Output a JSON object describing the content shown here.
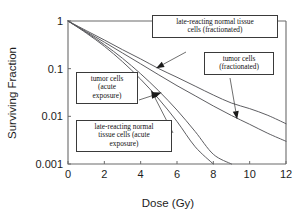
{
  "chart_data": {
    "type": "line",
    "title": "",
    "xlabel": "Dose (Gy)",
    "ylabel": "Surviving Fraction",
    "xlim": [
      0,
      12
    ],
    "ylim": [
      0.001,
      1
    ],
    "yscale": "log",
    "grid": false,
    "legend_position": "annotations",
    "xticks": [
      "0",
      "2",
      "4",
      "6",
      "8",
      "10",
      "12"
    ],
    "xtick_values": [
      0,
      2,
      4,
      6,
      8,
      10,
      12
    ],
    "yticks": [
      "1",
      "0.1",
      "0.01",
      "0.001"
    ],
    "ytick_values": [
      1,
      0.1,
      0.01,
      0.001
    ],
    "x": [
      0,
      1,
      2,
      3,
      4,
      5,
      6,
      7,
      8,
      9,
      10,
      11,
      12
    ],
    "series": [
      {
        "name": "late-reacting normal tissue cells (fractionated)",
        "values": [
          1,
          0.63,
          0.4,
          0.25,
          0.16,
          0.1,
          0.066,
          0.043,
          0.028,
          0.019,
          0.0145,
          0.0105,
          0.007
        ]
      },
      {
        "name": "tumor cells (fractionated)",
        "values": [
          1,
          0.6,
          0.36,
          0.213,
          0.126,
          0.074,
          0.044,
          0.027,
          0.0165,
          0.0104,
          0.0068,
          0.0044,
          0.003
        ]
      },
      {
        "name": "tumor cells (acute exposure)",
        "values": [
          1,
          0.58,
          0.32,
          0.165,
          0.078,
          0.034,
          0.0135,
          0.0048,
          0.0016,
          0.001,
          null,
          null,
          null
        ]
      },
      {
        "name": "late-reacting normal tissue cells (acute exposure)",
        "values": [
          1,
          0.56,
          0.295,
          0.14,
          0.06,
          0.023,
          0.0078,
          0.0023,
          0.001,
          null,
          null,
          null,
          null
        ]
      }
    ],
    "annotations": [
      {
        "id": "lrnt-fractionated",
        "text": "late-reacting normal tissue\ncells (fractionated)",
        "points_to_series": "late-reacting normal tissue cells (fractionated)",
        "points_to_x": 4.9
      },
      {
        "id": "tumor-fractionated",
        "text": "tumor cells\n(fractionated)",
        "points_to_series": "tumor cells (fractionated)",
        "points_to_x": 9.3
      },
      {
        "id": "tumor-acute",
        "text": "tumor cells\n(acute\nexposure)",
        "points_to_series": "tumor cells (acute exposure)",
        "points_to_x": 5.1
      },
      {
        "id": "lrnt-acute",
        "text": "late-reacting normal\ntissue cells (acute\nexposure)",
        "points_to_series": "late-reacting normal tissue cells (acute exposure)",
        "points_to_x": 4.6
      }
    ]
  },
  "colors": {
    "background": "#ffffff",
    "axis": "#6b6b6b",
    "curve": "#55555a",
    "text": "#1d1d1d",
    "callout_border": "#3a3a3a",
    "arrow": "#1a1a1a"
  }
}
